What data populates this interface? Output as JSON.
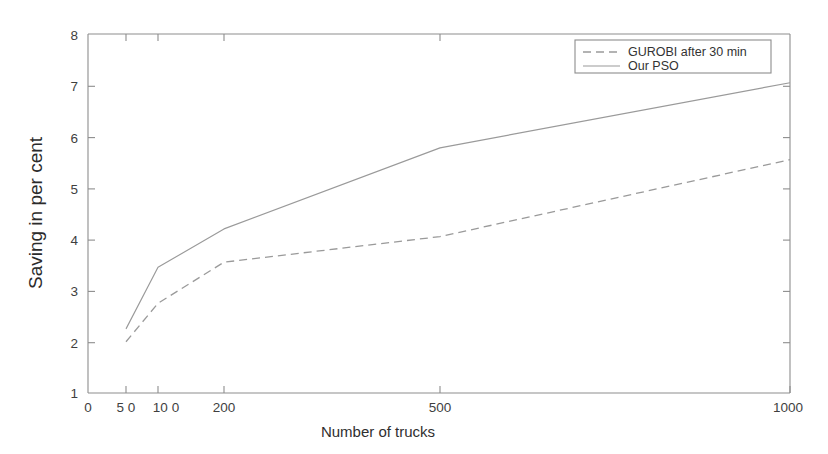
{
  "chart_data": {
    "type": "line",
    "title": "",
    "xlabel": "Number of trucks",
    "ylabel": "Saving in per cent",
    "x": [
      50,
      100,
      200,
      500,
      1000
    ],
    "xtick_labels": [
      "0",
      "5 0",
      "10 0",
      "200",
      "500",
      "1000"
    ],
    "xtick_values": [
      0,
      50,
      100,
      200,
      500,
      1000
    ],
    "ytick_labels": [
      "1",
      "2",
      "3",
      "4",
      "5",
      "6",
      "7",
      "8"
    ],
    "ytick_values": [
      1,
      2,
      3,
      4,
      5,
      6,
      7,
      8
    ],
    "ylim": [
      1,
      8
    ],
    "xlim": [
      0,
      1000
    ],
    "grid": false,
    "legend_position": "top-right",
    "series": [
      {
        "name": "GUROBI after 30 min",
        "style": "dashed",
        "values": [
          2.0,
          2.75,
          3.55,
          4.05,
          5.55
        ]
      },
      {
        "name": "Our PSO",
        "style": "solid",
        "values": [
          2.25,
          3.45,
          4.2,
          5.78,
          7.05
        ]
      }
    ],
    "colors": {
      "line": "#9a9a9a",
      "axis": "#8d8d8d",
      "text": "#333333",
      "background": "#ffffff"
    }
  },
  "legend": {
    "entries": [
      {
        "label": "GUROBI after 30 min"
      },
      {
        "label": "Our PSO"
      }
    ]
  },
  "axes": {
    "x_title": "Number of trucks",
    "y_title": "Saving in per cent",
    "x_labels": {
      "t0": "0",
      "t50": "5 0",
      "t100": "10 0",
      "t200": "200",
      "t500": "500",
      "t1000": "1000"
    },
    "y_labels": {
      "v1": "1",
      "v2": "2",
      "v3": "3",
      "v4": "4",
      "v5": "5",
      "v6": "6",
      "v7": "7",
      "v8": "8"
    }
  }
}
